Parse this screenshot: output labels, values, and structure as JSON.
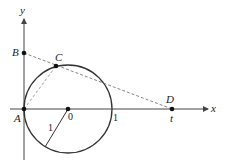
{
  "diagram": {
    "type": "geometry",
    "axes": {
      "x_label": "x",
      "y_label": "y"
    },
    "points": [
      {
        "id": "A",
        "label": "A",
        "px": [
          24,
          109
        ]
      },
      {
        "id": "B",
        "label": "B",
        "px": [
          24,
          53
        ]
      },
      {
        "id": "C",
        "label": "C",
        "px": [
          56,
          66
        ]
      },
      {
        "id": "D",
        "label": "D",
        "px": [
          172,
          109
        ]
      },
      {
        "id": "O",
        "label": "0",
        "px": [
          68,
          109
        ]
      }
    ],
    "circle": {
      "center_label": "0",
      "radius_label": "1",
      "cx": 68,
      "cy": 109,
      "r": 44
    },
    "tick_labels": {
      "circle_right": "1",
      "d_position": "t"
    },
    "colors": {
      "stroke": "#333333",
      "dashed": "#777777",
      "text": "#222222"
    }
  }
}
